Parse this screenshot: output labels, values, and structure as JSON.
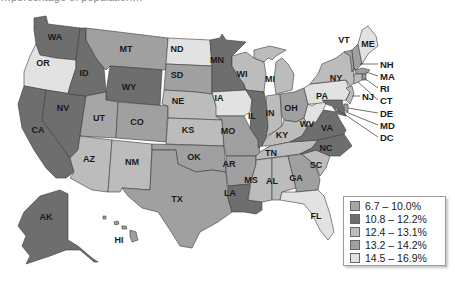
{
  "title_fragment": "…percentage of population…",
  "legend": {
    "classes": [
      {
        "label": "6.7 – 10.0%",
        "color": "#a6a6a6"
      },
      {
        "label": "10.8 – 12.2%",
        "color": "#6e6e6e"
      },
      {
        "label": "12.4 – 13.1%",
        "color": "#bcbcbc"
      },
      {
        "label": "13.2 – 14.2%",
        "color": "#a0a0a0"
      },
      {
        "label": "14.5 – 16.9%",
        "color": "#e2e2e2"
      }
    ]
  },
  "states": {
    "WA": {
      "label": "WA",
      "class": 1
    },
    "OR": {
      "label": "OR",
      "class": 4
    },
    "CA": {
      "label": "CA",
      "class": 1
    },
    "NV": {
      "label": "NV",
      "class": 1
    },
    "ID": {
      "label": "ID",
      "class": 1
    },
    "MT": {
      "label": "MT",
      "class": 3
    },
    "WY": {
      "label": "WY",
      "class": 1
    },
    "UT": {
      "label": "UT",
      "class": 0
    },
    "CO": {
      "label": "CO",
      "class": 3
    },
    "AZ": {
      "label": "AZ",
      "class": 2
    },
    "NM": {
      "label": "NM",
      "class": 2
    },
    "ND": {
      "label": "ND",
      "class": 4
    },
    "SD": {
      "label": "SD",
      "class": 3
    },
    "NE": {
      "label": "NE",
      "class": 2
    },
    "KS": {
      "label": "KS",
      "class": 2
    },
    "OK": {
      "label": "OK",
      "class": 3
    },
    "TX": {
      "label": "TX",
      "class": 3
    },
    "MN": {
      "label": "MN",
      "class": 1
    },
    "IA": {
      "label": "IA",
      "class": 4
    },
    "MO": {
      "label": "MO",
      "class": 3
    },
    "AR": {
      "label": "AR",
      "class": 3
    },
    "LA": {
      "label": "LA",
      "class": 1
    },
    "WI": {
      "label": "WI",
      "class": 2
    },
    "IL": {
      "label": "IL",
      "class": 1
    },
    "MI": {
      "label": "MI",
      "class": 2
    },
    "IN": {
      "label": "IN",
      "class": 2
    },
    "OH": {
      "label": "OH",
      "class": 3
    },
    "KY": {
      "label": "KY",
      "class": 2
    },
    "TN": {
      "label": "TN",
      "class": 2
    },
    "MS": {
      "label": "MS",
      "class": 2
    },
    "AL": {
      "label": "AL",
      "class": 2
    },
    "GA": {
      "label": "GA",
      "class": 3
    },
    "FL": {
      "label": "FL",
      "class": 4
    },
    "SC": {
      "label": "SC",
      "class": 2
    },
    "NC": {
      "label": "NC",
      "class": 1
    },
    "VA": {
      "label": "VA",
      "class": 1
    },
    "WV": {
      "label": "WV",
      "class": 4
    },
    "PA": {
      "label": "PA",
      "class": 4
    },
    "NY": {
      "label": "NY",
      "class": 2
    },
    "VT": {
      "label": "VT",
      "class": 3
    },
    "NH": {
      "label": "NH",
      "class": 3
    },
    "ME": {
      "label": "ME",
      "class": 4
    },
    "MA": {
      "label": "MA",
      "class": 3
    },
    "RI": {
      "label": "RI",
      "class": 3
    },
    "CT": {
      "label": "CT",
      "class": 2
    },
    "NJ": {
      "label": "NJ",
      "class": 2
    },
    "DE": {
      "label": "DE",
      "class": 3
    },
    "MD": {
      "label": "MD",
      "class": 1
    },
    "DC": {
      "label": "DC",
      "class": 0
    },
    "AK": {
      "label": "AK",
      "class": 1
    },
    "HI": {
      "label": "HI",
      "class": 3
    }
  }
}
